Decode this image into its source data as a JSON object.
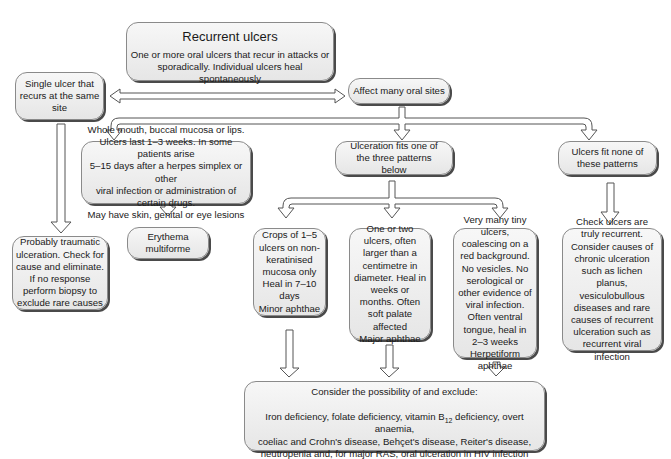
{
  "diagram": {
    "root": {
      "title": "Recurrent ulcers",
      "text": "One or more oral ulcers that recur in attacks or sporadically. Individual ulcers heal spontaneously"
    },
    "single_site": {
      "text": "Single ulcer that recurs at the same site"
    },
    "many_sites": {
      "text": "Affect many oral sites"
    },
    "traumatic": {
      "text": "Probably traumatic ulceration. Check for cause and eliminate. If no response perform biopsy to exclude rare causes"
    },
    "whole_mouth": {
      "lines": [
        "Whole mouth, buccal mucosa or lips.",
        "Ulcers last 1–3 weeks. In some patients arise",
        "5–15 days after a herpes simplex or other",
        "viral infection or administration of certain drugs.",
        "May have skin, genital or eye lesions"
      ]
    },
    "erythema": {
      "text": "Erythema multiforme"
    },
    "fits_patterns": {
      "text": "Ulceration fits one of the three patterns below"
    },
    "fits_none": {
      "text": "Ulcers fit none of these patterns"
    },
    "minor": {
      "text": "Crops of 1–5 ulcers on non-keratinised mucosa only Heal in 7–10 days",
      "label": "Minor aphthae"
    },
    "major": {
      "text": "One or two ulcers, often larger than a centimetre in diameter. Heal in weeks or months. Often soft palate affected",
      "label": "Major aphthae"
    },
    "herpetiform": {
      "text": "Very many tiny ulcers, coalescing on a red background. No vesicles. No serological or other evidence of viral infection. Often ventral tongue, heal in 2–3 weeks",
      "label": "Herpetiform aphthae"
    },
    "check_recurrent": {
      "text": "Check ulcers are truly recurrent. Consider causes of chronic ulceration such as lichen planus, vesiculobullous diseases and rare causes of recurrent ulceration such as recurrent viral infection"
    },
    "exclude": {
      "title": "Consider the possibility of and exclude:",
      "line1_a": "Iron deficiency, folate deficiency, vitamin B",
      "line1_sub": "12",
      "line1_b": " deficiency, overt anaemia,",
      "line2": "coeliac and Crohn's disease, Behçet's disease, Reiter's disease,",
      "line3": "neutropenia and, for major RAS, oral ulceration in HIV infection"
    }
  }
}
